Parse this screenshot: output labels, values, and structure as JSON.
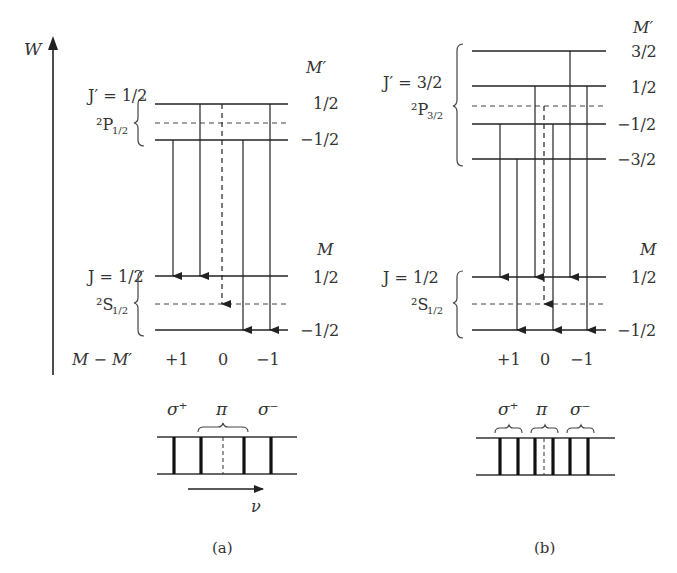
{
  "axis": {
    "label": "W"
  },
  "panel_a": {
    "caption": "(a)",
    "upper": {
      "J_label": "J′ = 1/2",
      "term": "²P",
      "term_sub": "1/2",
      "M_header": "M′",
      "levels": [
        "1/2",
        "−1/2"
      ]
    },
    "lower": {
      "J_label": "J = 1/2",
      "term": "²S",
      "term_sub": "1/2",
      "M_header": "M",
      "levels": [
        "1/2",
        "−1/2"
      ]
    },
    "delta_label": "M − M′",
    "delta_values": [
      "+1",
      "0",
      "−1"
    ],
    "spectrum": {
      "labels": [
        "σ⁺",
        "π",
        "σ⁻"
      ],
      "axis_label": "ν"
    }
  },
  "panel_b": {
    "caption": "(b)",
    "upper": {
      "J_label": "J′ = 3/2",
      "term": "²P",
      "term_sub": "3/2",
      "M_header": "M′",
      "levels": [
        "3/2",
        "1/2",
        "−1/2",
        "−3/2"
      ]
    },
    "lower": {
      "J_label": "J = 1/2",
      "term": "²S",
      "term_sub": "1/2",
      "M_header": "M",
      "levels": [
        "1/2",
        "−1/2"
      ]
    },
    "delta_values": [
      "+1",
      "0",
      "−1"
    ],
    "spectrum": {
      "labels": [
        "σ⁺",
        "π",
        "σ⁻"
      ]
    }
  }
}
